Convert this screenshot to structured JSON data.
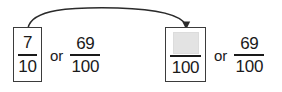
{
  "figure": {
    "type": "math-equivalence-diagram",
    "background_color": "#ffffff",
    "ink_color": "#1a1a1a",
    "box_border_color": "#3b3b3b",
    "shade_color": "#e3e3e3"
  },
  "arrow": {
    "name": "curved-arrow",
    "description": "curved arc with downward arrowhead connecting left boxed fraction to right boxed fraction",
    "color": "#2b2b2b"
  },
  "left_expression": {
    "boxed_fraction": {
      "numerator": "7",
      "denominator": "10"
    },
    "connector": "or",
    "plain_fraction": {
      "numerator": "69",
      "denominator": "100"
    }
  },
  "right_expression": {
    "boxed_fraction": {
      "numerator": "",
      "numerator_state": "blank-shaded",
      "denominator": "100"
    },
    "connector": "or",
    "plain_fraction": {
      "numerator": "69",
      "denominator": "100"
    }
  }
}
